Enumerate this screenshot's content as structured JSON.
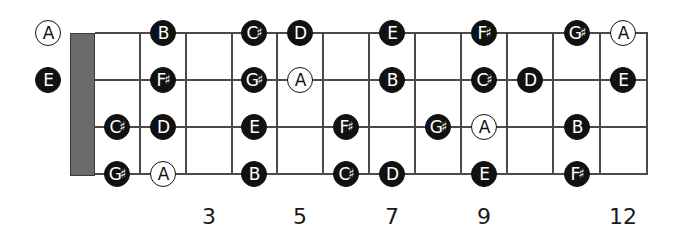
{
  "diagram": {
    "type": "bass-fretboard",
    "colors": {
      "filled_note": "#111111",
      "outline_note": "#ffffff",
      "nut": "#6b6b6b",
      "lines": "#4a4a4a"
    },
    "geometry": {
      "strings_y": [
        33,
        80,
        127,
        174
      ],
      "nut": {
        "x": 70,
        "width": 25,
        "top": 33,
        "bottom": 176
      },
      "frets_x": [
        140,
        186,
        232,
        277,
        323,
        369,
        415,
        461,
        507,
        553,
        600,
        647
      ],
      "fret_centers_x": [
        48,
        117,
        163,
        209,
        254,
        300,
        346,
        392,
        438,
        484,
        530,
        577,
        623
      ],
      "fretboard_right": 647
    },
    "fret_markers": [
      {
        "fret": 3,
        "label": "3"
      },
      {
        "fret": 5,
        "label": "5"
      },
      {
        "fret": 7,
        "label": "7"
      },
      {
        "fret": 9,
        "label": "9"
      },
      {
        "fret": 12,
        "label": "12"
      }
    ],
    "notes": [
      {
        "string": 0,
        "fret": 0,
        "name": "A",
        "style": "outline"
      },
      {
        "string": 0,
        "fret": 2,
        "name": "B",
        "style": "filled"
      },
      {
        "string": 0,
        "fret": 4,
        "name": "C♯",
        "style": "filled"
      },
      {
        "string": 0,
        "fret": 5,
        "name": "D",
        "style": "filled"
      },
      {
        "string": 0,
        "fret": 7,
        "name": "E",
        "style": "filled"
      },
      {
        "string": 0,
        "fret": 9,
        "name": "F♯",
        "style": "filled"
      },
      {
        "string": 0,
        "fret": 11,
        "name": "G♯",
        "style": "filled"
      },
      {
        "string": 0,
        "fret": 12,
        "name": "A",
        "style": "outline"
      },
      {
        "string": 1,
        "fret": 0,
        "name": "E",
        "style": "filled"
      },
      {
        "string": 1,
        "fret": 2,
        "name": "F♯",
        "style": "filled"
      },
      {
        "string": 1,
        "fret": 4,
        "name": "G♯",
        "style": "filled"
      },
      {
        "string": 1,
        "fret": 5,
        "name": "A",
        "style": "outline"
      },
      {
        "string": 1,
        "fret": 7,
        "name": "B",
        "style": "filled"
      },
      {
        "string": 1,
        "fret": 9,
        "name": "C♯",
        "style": "filled"
      },
      {
        "string": 1,
        "fret": 10,
        "name": "D",
        "style": "filled"
      },
      {
        "string": 1,
        "fret": 12,
        "name": "E",
        "style": "filled"
      },
      {
        "string": 2,
        "fret": 1,
        "name": "C♯",
        "style": "filled"
      },
      {
        "string": 2,
        "fret": 2,
        "name": "D",
        "style": "filled"
      },
      {
        "string": 2,
        "fret": 4,
        "name": "E",
        "style": "filled"
      },
      {
        "string": 2,
        "fret": 6,
        "name": "F♯",
        "style": "filled"
      },
      {
        "string": 2,
        "fret": 8,
        "name": "G♯",
        "style": "filled"
      },
      {
        "string": 2,
        "fret": 9,
        "name": "A",
        "style": "outline"
      },
      {
        "string": 2,
        "fret": 11,
        "name": "B",
        "style": "filled"
      },
      {
        "string": 3,
        "fret": 1,
        "name": "G♯",
        "style": "filled"
      },
      {
        "string": 3,
        "fret": 2,
        "name": "A",
        "style": "outline"
      },
      {
        "string": 3,
        "fret": 4,
        "name": "B",
        "style": "filled"
      },
      {
        "string": 3,
        "fret": 6,
        "name": "C♯",
        "style": "filled"
      },
      {
        "string": 3,
        "fret": 7,
        "name": "D",
        "style": "filled"
      },
      {
        "string": 3,
        "fret": 9,
        "name": "E",
        "style": "filled"
      },
      {
        "string": 3,
        "fret": 11,
        "name": "F♯",
        "style": "filled"
      }
    ]
  }
}
